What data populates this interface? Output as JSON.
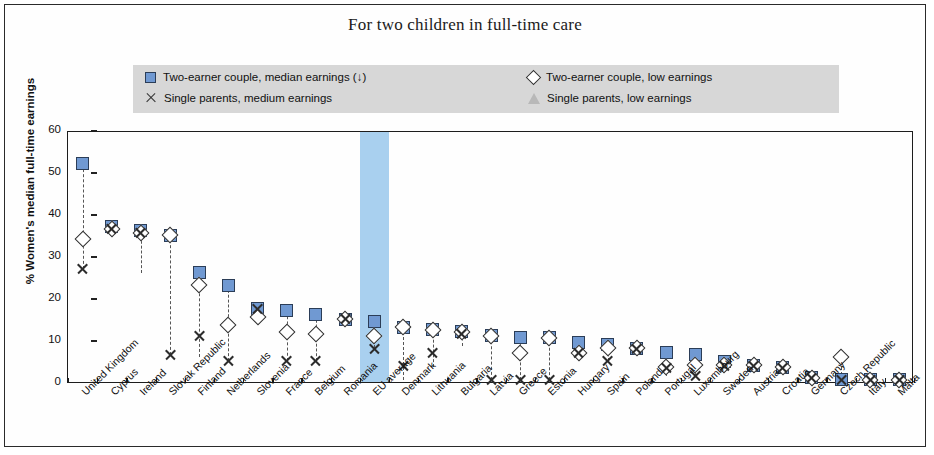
{
  "title": "For two children in full-time care",
  "axes": {
    "ylabel": "% Women's median full-time earnings",
    "yticks": [
      "0",
      "10",
      "20",
      "30",
      "40",
      "50",
      "60"
    ],
    "ymin": 0,
    "ymax": 60
  },
  "legend": {
    "items": [
      {
        "marker": "square",
        "label": "Two-earner couple, median earnings (↓)"
      },
      {
        "marker": "x",
        "label": "Single parents, medium  earnings"
      },
      {
        "marker": "diamond",
        "label": "Two-earner couple, low earnings"
      },
      {
        "marker": "triangle",
        "label": "Single parents, low earnings"
      }
    ],
    "background": "#d7d7d7"
  },
  "highlight": {
    "category": "EU average",
    "color": "#a9d0ef"
  },
  "colors": {
    "square_fill": "#7099d2",
    "square_edge": "#2b3d57",
    "triangle_fill": "#b0b0b0",
    "marker_edge": "#2c2c2c",
    "frame": "#1d1d1d"
  },
  "chart_data": {
    "type": "scatter",
    "title": "For two children in full-time care",
    "xlabel": "",
    "ylabel": "% Women's median full-time earnings",
    "ylim": [
      0,
      60
    ],
    "grid": false,
    "legend_position": "top",
    "categories": [
      "United Kingdom",
      "Cyprus",
      "Ireland",
      "Slovak Republic",
      "Finland",
      "Netherlands",
      "Slovenia",
      "France",
      "Belgium",
      "Romania",
      "EU average",
      "Denmark",
      "Lithuania",
      "Bulgaria",
      "Latvia",
      "Greece",
      "Estonia",
      "Hungary",
      "Spain",
      "Poland",
      "Portugal",
      "Luxembourg",
      "Sweden",
      "Austria",
      "Croatia",
      "Germany",
      "Czech Republic",
      "Italy",
      "Malta"
    ],
    "series": [
      {
        "name": "Two-earner couple, median earnings (↓)",
        "marker": "square",
        "values": [
          52,
          37,
          36,
          35,
          26,
          23,
          17.5,
          17,
          16,
          15,
          14.5,
          13,
          12.5,
          12,
          11,
          10.5,
          10.5,
          9.5,
          9,
          8,
          7,
          6.5,
          5,
          4,
          3.5,
          1,
          0.5,
          0.5,
          0.5
        ]
      },
      {
        "name": "Two-earner couple, low earnings",
        "marker": "diamond",
        "values": [
          34,
          36.5,
          35.5,
          35,
          23,
          13.5,
          15.5,
          12,
          11.5,
          15,
          11,
          13,
          12.5,
          12,
          11,
          7,
          10.5,
          7,
          8,
          8,
          3.5,
          4,
          4,
          4,
          3.5,
          1,
          6,
          0.5,
          0.5
        ]
      },
      {
        "name": "Single parents, medium  earnings",
        "marker": "x",
        "values": [
          27,
          36.5,
          35.5,
          6.5,
          11,
          5,
          17.5,
          5,
          5,
          15,
          8,
          4,
          7,
          11.5,
          0.5,
          0.5,
          0.5,
          7,
          5,
          8,
          3.5,
          1.5,
          4,
          4,
          3.5,
          1,
          0.5,
          0.5,
          0.5
        ]
      },
      {
        "name": "Single parents, low earnings",
        "marker": "triangle",
        "values": [
          27.5,
          37,
          26,
          35,
          6,
          5,
          18,
          5,
          5,
          15,
          8,
          0.5,
          3.5,
          8.5,
          0.5,
          0.5,
          1.5,
          5.5,
          5,
          8,
          1.5,
          1.5,
          4,
          4,
          3.5,
          1,
          0.5,
          0.5,
          0.5
        ]
      }
    ]
  }
}
